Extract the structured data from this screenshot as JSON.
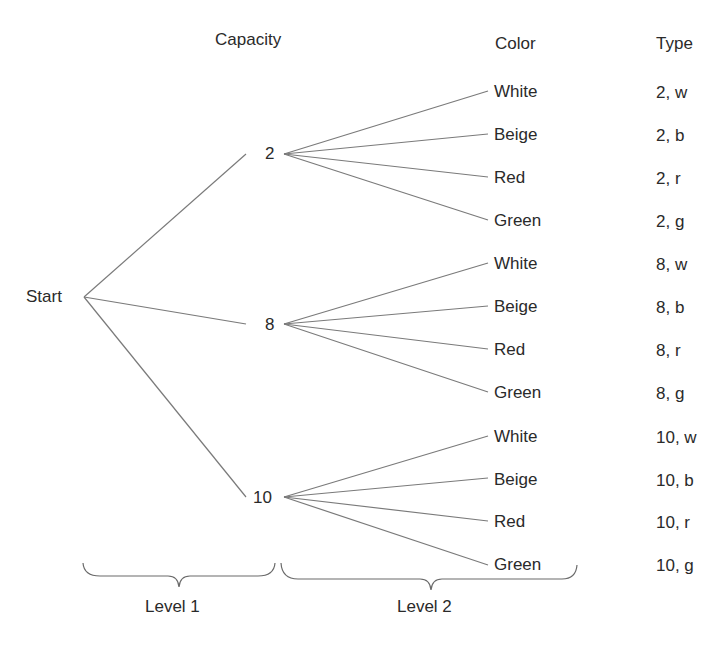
{
  "headers": {
    "capacity": "Capacity",
    "color": "Color",
    "type": "Type"
  },
  "root": {
    "label": "Start"
  },
  "capacities": [
    {
      "label": "2",
      "colors": [
        {
          "label": "White",
          "type": "2, w"
        },
        {
          "label": "Beige",
          "type": "2, b"
        },
        {
          "label": "Red",
          "type": "2, r"
        },
        {
          "label": "Green",
          "type": "2, g"
        }
      ]
    },
    {
      "label": "8",
      "colors": [
        {
          "label": "White",
          "type": "8, w"
        },
        {
          "label": "Beige",
          "type": "8, b"
        },
        {
          "label": "Red",
          "type": "8, r"
        },
        {
          "label": "Green",
          "type": "8, g"
        }
      ]
    },
    {
      "label": "10",
      "colors": [
        {
          "label": "White",
          "type": "10, w"
        },
        {
          "label": "Beige",
          "type": "10, b"
        },
        {
          "label": "Red",
          "type": "10, r"
        },
        {
          "label": "Green",
          "type": "10, g"
        }
      ]
    }
  ],
  "levels": {
    "level1": "Level 1",
    "level2": "Level 2"
  },
  "colors": {
    "line": "#7a7a7a",
    "text": "#2a2a2a"
  }
}
